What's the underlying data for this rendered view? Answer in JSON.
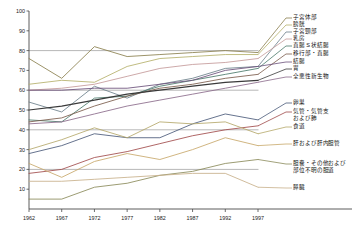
{
  "panel": {
    "title": "女性"
  },
  "axes": {
    "y_title": "五年生存率 (%)",
    "x_title": "年",
    "y_ticks": [
      "10",
      "20",
      "30",
      "40",
      "50",
      "60",
      "70",
      "80",
      "90",
      "100"
    ],
    "x_ticks": [
      "1962",
      "1967",
      "1972",
      "1977",
      "1982",
      "1987",
      "1992",
      "1997"
    ]
  },
  "legend": [
    {
      "label": "子宮体部",
      "color": "#8a7f4e"
    },
    {
      "label": "膀胱",
      "color": "#b5b06a"
    },
    {
      "label": "子宮頸部",
      "color": "#6b7f8a"
    },
    {
      "label": "乳房",
      "color": "#c49a9a"
    },
    {
      "label": "直腸 S 状結腸",
      "color": "#4a7a6a"
    },
    {
      "label": "移行部・直腸",
      "color": "#7a5b4a"
    },
    {
      "label": "結腸",
      "color": "#6a4f7a"
    },
    {
      "label": "胃",
      "color": "#3a3a3a"
    },
    {
      "label": "全悪性新生物",
      "color": "#8a6a8a"
    },
    {
      "label": "卵巣",
      "color": "#4a5a7a"
    },
    {
      "label": "気管・気管支\nおよび肺",
      "color": "#a04a4a"
    },
    {
      "label": "食道",
      "color": "#b5a86a"
    },
    {
      "label": "肝および肝内胆管",
      "color": "#c8a86a"
    },
    {
      "label": "胆嚢・その他および\n部位不明の胆道",
      "color": "#8a8a5a"
    },
    {
      "label": "膵臓",
      "color": "#c8b08a"
    }
  ],
  "chart_data": {
    "type": "line",
    "title": "女性",
    "xlabel": "年",
    "ylabel": "五年生存率 (%)",
    "xlim": [
      1962,
      1997
    ],
    "ylim": [
      0,
      100
    ],
    "grid": true,
    "legend_position": "right",
    "x": [
      1962,
      1967,
      1972,
      1977,
      1982,
      1987,
      1992,
      1997
    ],
    "series": [
      {
        "name": "子宮体部",
        "color": "#8a7f4e",
        "values": [
          76,
          66,
          82,
          77,
          78,
          79,
          80,
          79
        ]
      },
      {
        "name": "膀胱",
        "color": "#b5b06a",
        "values": [
          63,
          65,
          64,
          72,
          76,
          77,
          78,
          78
        ]
      },
      {
        "name": "子宮頸部",
        "color": "#6b7f8a",
        "values": [
          54,
          49,
          62,
          56,
          63,
          66,
          71,
          72
        ]
      },
      {
        "name": "乳房",
        "color": "#c49a9a",
        "values": [
          60,
          61,
          63,
          67,
          71,
          73,
          74,
          76
        ]
      },
      {
        "name": "直腸 S 状結腸",
        "color": "#4a7a6a",
        "values": [
          45,
          44,
          56,
          57,
          62,
          65,
          68,
          71
        ]
      },
      {
        "name": "移行部・直腸",
        "color": "#7a5b4a",
        "values": [
          44,
          46,
          52,
          57,
          61,
          63,
          66,
          68
        ]
      },
      {
        "name": "結腸",
        "color": "#6a4f7a",
        "values": [
          60,
          60,
          61,
          61,
          63,
          65,
          70,
          72
        ]
      },
      {
        "name": "胃",
        "color": "#3a3a3a",
        "values": [
          50,
          52,
          55,
          58,
          60,
          62,
          64,
          65
        ]
      },
      {
        "name": "全悪性新生物",
        "color": "#8a6a8a",
        "values": [
          43,
          44,
          48,
          52,
          55,
          58,
          61,
          64
        ]
      },
      {
        "name": "卵巣",
        "color": "#4a5a7a",
        "values": [
          28,
          32,
          38,
          36,
          36,
          43,
          48,
          45
        ]
      },
      {
        "name": "気管・気管支および肺",
        "color": "#a04a4a",
        "values": [
          18,
          20,
          26,
          29,
          33,
          37,
          40,
          42
        ]
      },
      {
        "name": "食道",
        "color": "#b5a86a",
        "values": [
          30,
          35,
          41,
          36,
          44,
          43,
          44,
          38
        ]
      },
      {
        "name": "肝および肝内胆管",
        "color": "#c8a86a",
        "values": [
          23,
          16,
          24,
          28,
          25,
          30,
          36,
          32
        ]
      },
      {
        "name": "胆嚢・その他および部位不明の胆道",
        "color": "#8a8a5a",
        "values": [
          5,
          5,
          11,
          13,
          17,
          19,
          23,
          25
        ]
      },
      {
        "name": "膵臓",
        "color": "#c8b08a",
        "values": [
          14,
          14,
          15,
          16,
          17,
          18,
          18,
          11
        ]
      }
    ]
  }
}
